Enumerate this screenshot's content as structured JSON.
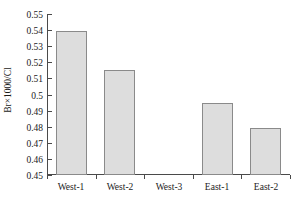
{
  "chart_data": {
    "type": "bar",
    "title": "",
    "xlabel": "",
    "ylabel": "Br×1000/Cl",
    "categories": [
      "West-1",
      "West-2",
      "West-3",
      "East-1",
      "East-2"
    ],
    "values": [
      0.5395,
      0.5152,
      null,
      0.495,
      0.4795
    ],
    "ylim": [
      0.45,
      0.55
    ],
    "ytick_labels": [
      "0.55",
      "0.54",
      "0.53",
      "0.52",
      "0.51",
      "0.5",
      "0.49",
      "0.48",
      "0.47",
      "0.46",
      "0.45"
    ],
    "ytick_values": [
      0.55,
      0.54,
      0.53,
      0.52,
      0.51,
      0.5,
      0.49,
      0.48,
      0.47,
      0.46,
      0.45
    ],
    "grid": false,
    "legend": null,
    "series": [
      {
        "name": "Br×1000/Cl",
        "values": [
          0.5395,
          0.5152,
          null,
          0.495,
          0.4795
        ]
      }
    ],
    "bar_fill_color": "#dddddd",
    "bar_edge_color": "#8a8a8a",
    "axis_color": "#4a4a4a",
    "background_color": "#ffffff"
  }
}
